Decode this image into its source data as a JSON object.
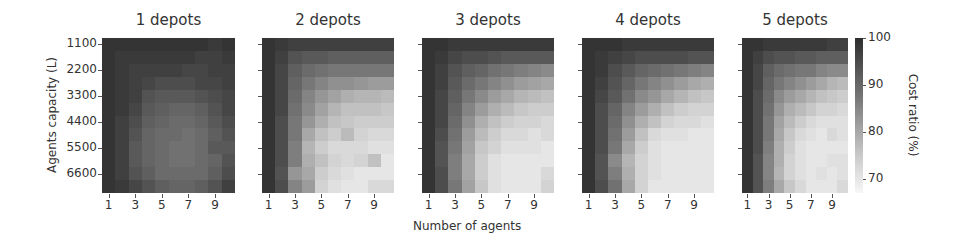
{
  "chart_data": [
    {
      "type": "heatmap",
      "title": "1 depots",
      "xlabel": "Number of agents",
      "ylabel": "Agents capacity (L)",
      "x": [
        1,
        2,
        3,
        4,
        5,
        6,
        7,
        8,
        9,
        10
      ],
      "y": [
        1100,
        1650,
        2200,
        2750,
        3300,
        3850,
        4400,
        4950,
        5500,
        6050,
        6600,
        7150
      ],
      "xticks": [
        "1",
        "3",
        "5",
        "7",
        "9"
      ],
      "yticks": [
        "1100",
        "2200",
        "3300",
        "4400",
        "5500",
        "6600"
      ],
      "values": [
        [
          99,
          99,
          99,
          99,
          99,
          99,
          99,
          99,
          98,
          99
        ],
        [
          99,
          98,
          98,
          98,
          98,
          98,
          98,
          97,
          97,
          98
        ],
        [
          99,
          98,
          97,
          97,
          97,
          97,
          96,
          96,
          97,
          97
        ],
        [
          99,
          98,
          97,
          96,
          95,
          95,
          95,
          96,
          96,
          97
        ],
        [
          99,
          98,
          97,
          94,
          93,
          93,
          93,
          94,
          95,
          96
        ],
        [
          99,
          98,
          96,
          93,
          92,
          91,
          91,
          92,
          94,
          96
        ],
        [
          99,
          97,
          95,
          92,
          91,
          90,
          90,
          91,
          93,
          95
        ],
        [
          99,
          97,
          94,
          91,
          90,
          90,
          89,
          90,
          92,
          94
        ],
        [
          99,
          97,
          93,
          91,
          90,
          89,
          89,
          90,
          93,
          93
        ],
        [
          99,
          97,
          93,
          91,
          90,
          89,
          89,
          90,
          91,
          94
        ],
        [
          99,
          97,
          94,
          92,
          90,
          90,
          90,
          90,
          92,
          95
        ],
        [
          99,
          98,
          96,
          94,
          92,
          91,
          91,
          92,
          94,
          97
        ]
      ]
    },
    {
      "type": "heatmap",
      "title": "2 depots",
      "x": [
        1,
        2,
        3,
        4,
        5,
        6,
        7,
        8,
        9,
        10
      ],
      "xticks": [
        "1",
        "3",
        "5",
        "7",
        "9"
      ],
      "values": [
        [
          99,
          98,
          97,
          97,
          97,
          97,
          97,
          97,
          97,
          97
        ],
        [
          99,
          97,
          94,
          93,
          93,
          92,
          92,
          92,
          92,
          92
        ],
        [
          99,
          96,
          92,
          90,
          89,
          88,
          88,
          88,
          88,
          88
        ],
        [
          99,
          96,
          91,
          88,
          86,
          84,
          84,
          83,
          82,
          82
        ],
        [
          99,
          96,
          90,
          86,
          83,
          81,
          79,
          78,
          78,
          77
        ],
        [
          99,
          96,
          89,
          85,
          81,
          78,
          76,
          76,
          76,
          75
        ],
        [
          99,
          95,
          88,
          83,
          79,
          76,
          75,
          74,
          74,
          74
        ],
        [
          99,
          95,
          88,
          80,
          76,
          74,
          77,
          73,
          72,
          72
        ],
        [
          99,
          95,
          87,
          78,
          74,
          72,
          72,
          72,
          71,
          71
        ],
        [
          99,
          95,
          87,
          79,
          76,
          73,
          72,
          73,
          76,
          70
        ],
        [
          99,
          94,
          83,
          80,
          74,
          72,
          71,
          70,
          70,
          70
        ],
        [
          99,
          95,
          86,
          82,
          73,
          71,
          70,
          70,
          72,
          72
        ]
      ]
    },
    {
      "type": "heatmap",
      "title": "3 depots",
      "x": [
        1,
        2,
        3,
        4,
        5,
        6,
        7,
        8,
        9,
        10
      ],
      "xticks": [
        "1",
        "3",
        "5",
        "7",
        "9"
      ],
      "values": [
        [
          99,
          99,
          98,
          98,
          98,
          98,
          98,
          98,
          98,
          98
        ],
        [
          99,
          98,
          96,
          95,
          95,
          94,
          93,
          93,
          93,
          93
        ],
        [
          99,
          97,
          94,
          92,
          91,
          89,
          88,
          87,
          86,
          85
        ],
        [
          99,
          97,
          93,
          90,
          88,
          86,
          84,
          82,
          81,
          80
        ],
        [
          99,
          96,
          92,
          88,
          85,
          82,
          80,
          78,
          77,
          76
        ],
        [
          99,
          96,
          91,
          86,
          82,
          79,
          77,
          75,
          74,
          74
        ],
        [
          99,
          96,
          90,
          84,
          79,
          76,
          74,
          73,
          73,
          72
        ],
        [
          99,
          95,
          89,
          82,
          77,
          74,
          72,
          72,
          71,
          72
        ],
        [
          99,
          94,
          88,
          81,
          75,
          73,
          71,
          71,
          71,
          70
        ],
        [
          99,
          94,
          87,
          80,
          74,
          71,
          70,
          70,
          70,
          70
        ],
        [
          99,
          95,
          87,
          80,
          74,
          71,
          70,
          70,
          70,
          72
        ],
        [
          99,
          95,
          88,
          81,
          75,
          71,
          70,
          70,
          70,
          73
        ]
      ]
    },
    {
      "type": "heatmap",
      "title": "4 depots",
      "x": [
        1,
        2,
        3,
        4,
        5,
        6,
        7,
        8,
        9,
        10
      ],
      "xticks": [
        "1",
        "3",
        "5",
        "7",
        "9"
      ],
      "values": [
        [
          99,
          99,
          99,
          98,
          98,
          98,
          98,
          98,
          98,
          98
        ],
        [
          99,
          98,
          97,
          96,
          95,
          95,
          95,
          95,
          94,
          94
        ],
        [
          99,
          98,
          95,
          93,
          91,
          90,
          89,
          88,
          87,
          86
        ],
        [
          99,
          97,
          94,
          91,
          88,
          86,
          84,
          82,
          80,
          79
        ],
        [
          99,
          96,
          93,
          89,
          85,
          83,
          80,
          78,
          76,
          75
        ],
        [
          99,
          95,
          91,
          86,
          82,
          79,
          76,
          74,
          73,
          73
        ],
        [
          99,
          95,
          90,
          84,
          79,
          76,
          73,
          72,
          72,
          71
        ],
        [
          99,
          95,
          89,
          82,
          76,
          72,
          71,
          71,
          70,
          70
        ],
        [
          99,
          95,
          88,
          80,
          74,
          71,
          70,
          70,
          70,
          70
        ],
        [
          99,
          94,
          85,
          78,
          73,
          71,
          70,
          70,
          70,
          70
        ],
        [
          99,
          94,
          87,
          79,
          73,
          71,
          70,
          70,
          70,
          70
        ],
        [
          99,
          95,
          89,
          80,
          73,
          70,
          70,
          70,
          70,
          70
        ]
      ]
    },
    {
      "type": "heatmap",
      "title": "5 depots",
      "x": [
        1,
        2,
        3,
        4,
        5,
        6,
        7,
        8,
        9,
        10
      ],
      "xticks": [
        "1",
        "3",
        "5",
        "7",
        "9"
      ],
      "values": [
        [
          99,
          99,
          98,
          98,
          98,
          98,
          98,
          98,
          97,
          97
        ],
        [
          99,
          97,
          95,
          94,
          94,
          93,
          93,
          92,
          92,
          92
        ],
        [
          99,
          96,
          92,
          90,
          89,
          88,
          88,
          86,
          85,
          85
        ],
        [
          99,
          96,
          91,
          88,
          86,
          84,
          82,
          80,
          78,
          77
        ],
        [
          99,
          95,
          90,
          85,
          82,
          80,
          78,
          76,
          75,
          74
        ],
        [
          99,
          95,
          89,
          83,
          79,
          77,
          75,
          73,
          73,
          72
        ],
        [
          99,
          95,
          88,
          81,
          77,
          74,
          72,
          71,
          71,
          71
        ],
        [
          99,
          95,
          88,
          80,
          75,
          72,
          71,
          70,
          72,
          71
        ],
        [
          99,
          95,
          87,
          79,
          74,
          71,
          70,
          70,
          70,
          70
        ],
        [
          99,
          94,
          86,
          79,
          73,
          71,
          70,
          70,
          71,
          71
        ],
        [
          99,
          94,
          86,
          78,
          73,
          71,
          70,
          71,
          70,
          71
        ],
        [
          99,
          94,
          87,
          80,
          75,
          72,
          70,
          70,
          70,
          72
        ]
      ]
    }
  ],
  "panels": [
    {
      "title": "1 depots"
    },
    {
      "title": "2 depots"
    },
    {
      "title": "3 depots"
    },
    {
      "title": "4 depots"
    },
    {
      "title": "5 depots"
    }
  ],
  "axes": {
    "xlabel": "Number of agents",
    "ylabel": "Agents capacity (L)",
    "xticks": [
      "1",
      "3",
      "5",
      "7",
      "9"
    ],
    "yticks": [
      "1100",
      "2200",
      "3300",
      "4400",
      "5500",
      "6600"
    ]
  },
  "colorbar": {
    "label": "Cost ratio (%)",
    "ticks": [
      "100",
      "90",
      "80",
      "70"
    ],
    "range": [
      67,
      100
    ],
    "colormap": "gray_r"
  }
}
